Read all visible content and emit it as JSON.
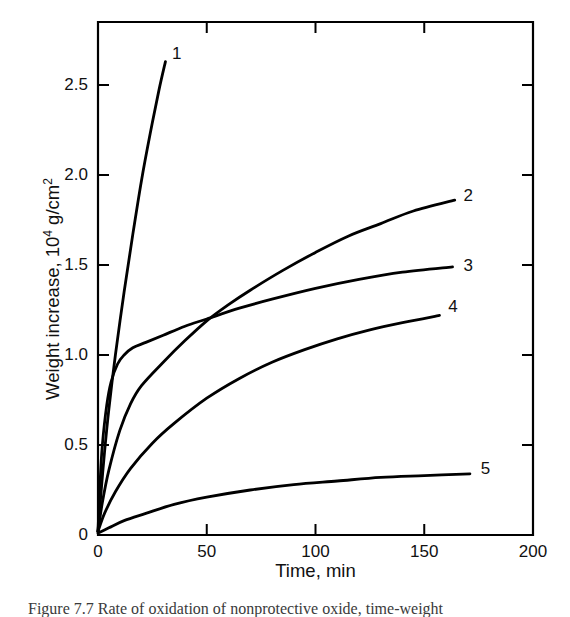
{
  "chart_data": {
    "type": "line",
    "title": "",
    "xlabel": "Time, min",
    "ylabel": "Weight increase, 10^4 g/cm^2",
    "ylabel_prefix": "Weight increase, 10",
    "ylabel_exponent": "4",
    "ylabel_suffix": " g/cm",
    "ylabel_unit_exponent": "2",
    "xlim": [
      0,
      200
    ],
    "ylim": [
      0,
      2.85
    ],
    "xticks": [
      0,
      50,
      100,
      150,
      200
    ],
    "xtick_labels": [
      "0",
      "50",
      "100",
      "150",
      "200"
    ],
    "yticks": [
      0,
      0.5,
      1.0,
      1.5,
      2.0,
      2.5
    ],
    "ytick_labels": [
      "0",
      "0.5",
      "1.0",
      "1.5",
      "2.0",
      "2.5"
    ],
    "grid": false,
    "legend_position": "inline-end-labels",
    "line_color": "#000000",
    "series": [
      {
        "name": "1",
        "label": "1",
        "label_x": 34,
        "label_y": 2.68,
        "points": [
          [
            0,
            0.02
          ],
          [
            1.5,
            0.25
          ],
          [
            3,
            0.46
          ],
          [
            5,
            0.7
          ],
          [
            8,
            1.0
          ],
          [
            12,
            1.35
          ],
          [
            16,
            1.67
          ],
          [
            20,
            1.97
          ],
          [
            24,
            2.23
          ],
          [
            28,
            2.47
          ],
          [
            31,
            2.63
          ]
        ]
      },
      {
        "name": "2",
        "label": "2",
        "label_x": 168,
        "label_y": 1.89,
        "points": [
          [
            0,
            0.02
          ],
          [
            2,
            0.18
          ],
          [
            5,
            0.36
          ],
          [
            10,
            0.58
          ],
          [
            15,
            0.73
          ],
          [
            20,
            0.83
          ],
          [
            30,
            0.96
          ],
          [
            40,
            1.08
          ],
          [
            50,
            1.19
          ],
          [
            60,
            1.28
          ],
          [
            70,
            1.36
          ],
          [
            85,
            1.47
          ],
          [
            100,
            1.57
          ],
          [
            115,
            1.66
          ],
          [
            130,
            1.73
          ],
          [
            145,
            1.8
          ],
          [
            164,
            1.86
          ]
        ]
      },
      {
        "name": "3",
        "label": "3",
        "label_x": 168,
        "label_y": 1.5,
        "points": [
          [
            0,
            0.02
          ],
          [
            1,
            0.3
          ],
          [
            2,
            0.5
          ],
          [
            4,
            0.72
          ],
          [
            6,
            0.85
          ],
          [
            9,
            0.95
          ],
          [
            12,
            1.0
          ],
          [
            16,
            1.04
          ],
          [
            22,
            1.07
          ],
          [
            30,
            1.11
          ],
          [
            40,
            1.16
          ],
          [
            50,
            1.2
          ],
          [
            65,
            1.26
          ],
          [
            80,
            1.31
          ],
          [
            100,
            1.37
          ],
          [
            120,
            1.42
          ],
          [
            140,
            1.46
          ],
          [
            163,
            1.49
          ]
        ]
      },
      {
        "name": "4",
        "label": "4",
        "label_x": 161,
        "label_y": 1.27,
        "points": [
          [
            0,
            0.02
          ],
          [
            3,
            0.12
          ],
          [
            8,
            0.24
          ],
          [
            15,
            0.37
          ],
          [
            25,
            0.51
          ],
          [
            35,
            0.62
          ],
          [
            50,
            0.76
          ],
          [
            65,
            0.87
          ],
          [
            80,
            0.96
          ],
          [
            95,
            1.03
          ],
          [
            110,
            1.09
          ],
          [
            125,
            1.14
          ],
          [
            140,
            1.18
          ],
          [
            157,
            1.22
          ]
        ]
      },
      {
        "name": "5",
        "label": "5",
        "label_x": 176,
        "label_y": 0.37,
        "points": [
          [
            0,
            0.01
          ],
          [
            5,
            0.04
          ],
          [
            12,
            0.08
          ],
          [
            22,
            0.12
          ],
          [
            35,
            0.17
          ],
          [
            50,
            0.21
          ],
          [
            70,
            0.25
          ],
          [
            90,
            0.28
          ],
          [
            110,
            0.3
          ],
          [
            130,
            0.32
          ],
          [
            150,
            0.33
          ],
          [
            171,
            0.34
          ]
        ]
      }
    ]
  },
  "caption": {
    "text": "Figure 7.7   Rate of oxidation of nonprotective oxide, time-weight"
  }
}
